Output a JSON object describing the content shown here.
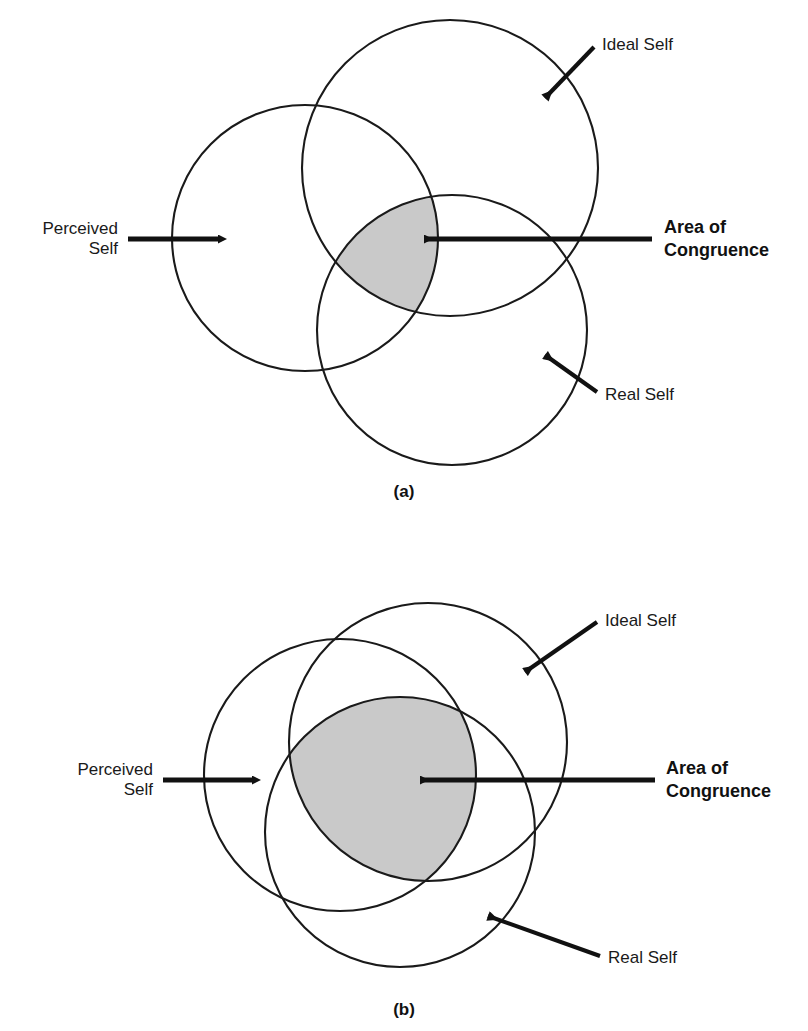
{
  "figure": {
    "type": "venn-diagram-pair",
    "shade_color": "#c9c9c9",
    "stroke_color": "#1a1a1a",
    "background_color": "#ffffff"
  },
  "panels": [
    {
      "id": "a",
      "caption": "(a)",
      "congruence_size": "small",
      "circles": [
        {
          "key": "perceived",
          "label": "Perceived\nSelf",
          "cx": 305,
          "cy": 238,
          "r": 133
        },
        {
          "key": "ideal",
          "label": "Ideal Self",
          "cx": 450,
          "cy": 168,
          "r": 148
        },
        {
          "key": "real",
          "label": "Real Self",
          "cx": 452,
          "cy": 330,
          "r": 135
        }
      ],
      "labels": {
        "perceived_line1": "Perceived",
        "perceived_line2": "Self",
        "ideal": "Ideal Self",
        "real": "Real Self",
        "congruence_line1": "Area of",
        "congruence_line2": "Congruence"
      }
    },
    {
      "id": "b",
      "caption": "(b)",
      "congruence_size": "large",
      "circles": [
        {
          "key": "perceived",
          "label": "Perceived\nSelf",
          "cx": 340,
          "cy": 775,
          "r": 136
        },
        {
          "key": "ideal",
          "label": "Ideal Self",
          "cx": 428,
          "cy": 742,
          "r": 139
        },
        {
          "key": "real",
          "label": "Real Self",
          "cx": 400,
          "cy": 832,
          "r": 135
        }
      ],
      "labels": {
        "perceived_line1": "Perceived",
        "perceived_line2": "Self",
        "ideal": "Ideal Self",
        "real": "Real Self",
        "congruence_line1": "Area of",
        "congruence_line2": "Congruence"
      }
    }
  ],
  "icons": {
    "arrow_right": "arrow-right-icon",
    "arrow_left": "arrow-left-icon",
    "arrow_diagonal": "arrow-diagonal-icon"
  }
}
